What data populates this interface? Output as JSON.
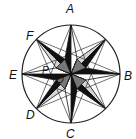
{
  "diagram": {
    "labels": {
      "A": "A",
      "B": "B",
      "C": "C",
      "D": "D",
      "E": "E",
      "F": "F",
      "P": "P",
      "O": "O"
    },
    "colors": {
      "stroke": "#111111",
      "dark": "#111111",
      "mid": "#777777",
      "light": "#d4d4d4",
      "white": "#ffffff"
    }
  }
}
